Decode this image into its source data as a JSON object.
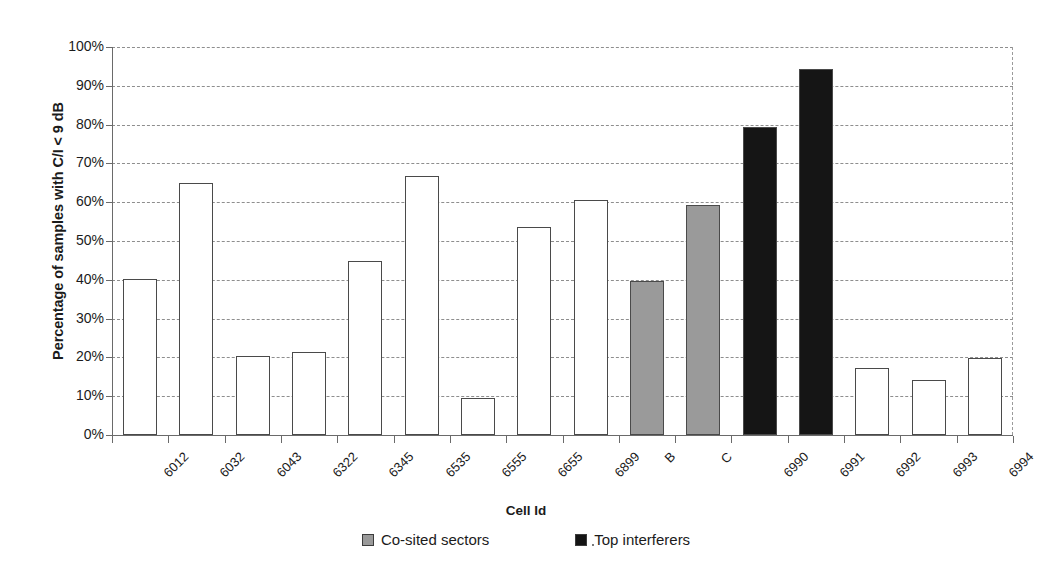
{
  "chart_data": {
    "type": "bar",
    "title": "",
    "xlabel": "Cell Id",
    "ylabel": "Percentage of samples with C/I < 9 dB",
    "ylim": [
      0,
      100
    ],
    "ytick_labels": [
      "0%",
      "10%",
      "20%",
      "30%",
      "40%",
      "50%",
      "60%",
      "70%",
      "80%",
      "90%",
      "100%"
    ],
    "ytick_values": [
      0,
      10,
      20,
      30,
      40,
      50,
      60,
      70,
      80,
      90,
      100
    ],
    "grid": true,
    "legend_position": "bottom",
    "categories": [
      "6012",
      "6032",
      "6043",
      "6322",
      "6345",
      "6535",
      "6555",
      "6655",
      "6899",
      "B",
      "C",
      "6990",
      "6991",
      "6992",
      "6993",
      "6994"
    ],
    "values": [
      40.1,
      64.9,
      20.3,
      21.5,
      44.8,
      66.8,
      9.6,
      53.6,
      60.6,
      39.6,
      59.3,
      79.3,
      94.3,
      17.3,
      14.2,
      19.9
    ],
    "series_of": [
      "normal",
      "normal",
      "normal",
      "normal",
      "normal",
      "normal",
      "normal",
      "normal",
      "normal",
      "co-sited",
      "co-sited",
      "top-interferer",
      "top-interferer",
      "normal",
      "normal",
      "normal"
    ],
    "legend": [
      {
        "label": "Co-sited sectors",
        "key": "co-sited",
        "color": "#9a9a9a"
      },
      {
        "label": "Top interferers",
        "key": "top-interferer",
        "color": "#151515"
      }
    ],
    "colors": {
      "normal": "#ffffff",
      "co-sited": "#9a9a9a",
      "top-interferer": "#151515",
      "bar_border": "#4a4a4a",
      "gridline": "#8e8e8e",
      "axis": "#6a6a6a",
      "text": "#1b1b1b"
    }
  }
}
